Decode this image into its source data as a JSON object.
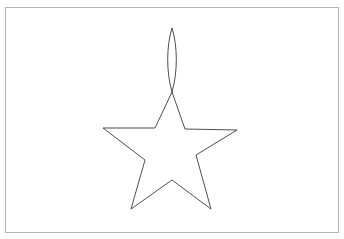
{
  "canvas": {
    "width": 344,
    "height": 239,
    "background_color": "#ffffff",
    "title": "Line drawing of a five-pointed star with a narrow lens shape above it"
  },
  "frame": {
    "name": "page-border",
    "x": 5,
    "y": 7,
    "width": 333,
    "height": 225,
    "stroke_color": "#b4b4b4",
    "stroke_width": 1,
    "fill": "none"
  },
  "shapes": [
    {
      "name": "star-outline",
      "type": "polygon",
      "stroke_color": "#3a3a3a",
      "stroke_width": 0.9,
      "fill": "none",
      "points": [
        [
          172,
          92
        ],
        [
          185,
          129
        ],
        [
          237,
          130
        ],
        [
          196,
          155
        ],
        [
          211,
          209
        ],
        [
          172,
          180
        ],
        [
          131,
          209
        ],
        [
          145,
          160
        ],
        [
          103,
          128
        ],
        [
          155,
          128
        ]
      ]
    },
    {
      "name": "lens-spike-outline",
      "type": "lens",
      "stroke_color": "#3a3a3a",
      "stroke_width": 0.9,
      "fill": "none",
      "top_tip": [
        172,
        28
      ],
      "bottom_tip": [
        172,
        92
      ],
      "left_extreme": [
        166,
        60
      ],
      "right_extreme": [
        178,
        60
      ]
    }
  ]
}
